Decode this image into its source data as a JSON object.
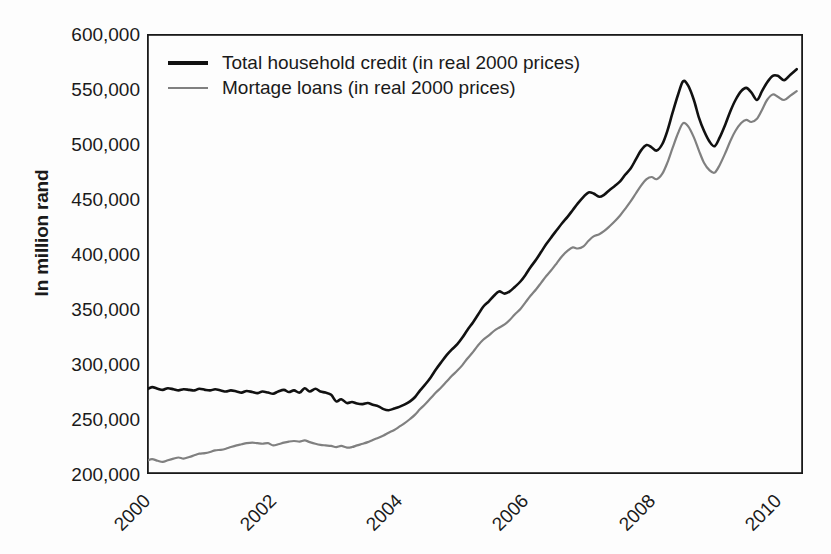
{
  "chart_data": {
    "type": "line",
    "title": "",
    "subtitle": "",
    "xlabel": "",
    "ylabel": "In million rand",
    "xlim": [
      2000.0,
      2010.4
    ],
    "ylim": [
      200000,
      600000
    ],
    "grid": false,
    "legend_position": "top-left-inside",
    "y_tick_labels": [
      "600,000",
      "550,000",
      "500,000",
      "450,000",
      "400,000",
      "350,000",
      "300,000",
      "250,000",
      "200,000"
    ],
    "y_tick_values": [
      600000,
      550000,
      500000,
      450000,
      400000,
      350000,
      300000,
      250000,
      200000
    ],
    "x_tick_labels": [
      "2000",
      "2002",
      "2004",
      "2006",
      "2008",
      "2010"
    ],
    "x_tick_values": [
      2000,
      2002,
      2004,
      2006,
      2008,
      2010
    ],
    "series": [
      {
        "name": "Total household credit (in real 2000 prices)",
        "color": "#111111",
        "width": 2.6,
        "x": [
          2000.0,
          2000.08,
          2000.17,
          2000.25,
          2000.33,
          2000.42,
          2000.5,
          2000.58,
          2000.67,
          2000.75,
          2000.83,
          2000.92,
          2001.0,
          2001.08,
          2001.17,
          2001.25,
          2001.33,
          2001.42,
          2001.5,
          2001.58,
          2001.67,
          2001.75,
          2001.83,
          2001.92,
          2002.0,
          2002.08,
          2002.17,
          2002.25,
          2002.33,
          2002.42,
          2002.5,
          2002.58,
          2002.67,
          2002.75,
          2002.83,
          2002.92,
          2003.0,
          2003.08,
          2003.17,
          2003.25,
          2003.33,
          2003.42,
          2003.5,
          2003.58,
          2003.67,
          2003.75,
          2003.83,
          2003.92,
          2004.0,
          2004.08,
          2004.17,
          2004.25,
          2004.33,
          2004.42,
          2004.5,
          2004.58,
          2004.67,
          2004.75,
          2004.83,
          2004.92,
          2005.0,
          2005.08,
          2005.17,
          2005.25,
          2005.33,
          2005.42,
          2005.5,
          2005.58,
          2005.67,
          2005.75,
          2005.83,
          2005.92,
          2006.0,
          2006.08,
          2006.17,
          2006.25,
          2006.33,
          2006.42,
          2006.5,
          2006.58,
          2006.67,
          2006.75,
          2006.83,
          2006.92,
          2007.0,
          2007.08,
          2007.17,
          2007.25,
          2007.33,
          2007.42,
          2007.5,
          2007.58,
          2007.67,
          2007.75,
          2007.83,
          2007.92,
          2008.0,
          2008.08,
          2008.17,
          2008.25,
          2008.33,
          2008.42,
          2008.5,
          2008.58,
          2008.67,
          2008.75,
          2008.83,
          2008.92,
          2009.0,
          2009.08,
          2009.17,
          2009.25,
          2009.33,
          2009.42,
          2009.5,
          2009.58,
          2009.67,
          2009.75,
          2009.83,
          2009.92,
          2010.0,
          2010.1,
          2010.2,
          2010.3
        ],
        "y": [
          277000,
          279000,
          277500,
          276500,
          278000,
          277000,
          276000,
          277000,
          276500,
          276000,
          277500,
          276500,
          276000,
          277000,
          276000,
          275000,
          276000,
          275000,
          274000,
          275500,
          274500,
          273500,
          275000,
          274000,
          273000,
          275000,
          276500,
          274500,
          276000,
          274000,
          278000,
          275000,
          277500,
          275000,
          274000,
          272000,
          266000,
          268000,
          264500,
          265500,
          264000,
          263500,
          264500,
          263000,
          261500,
          259000,
          258000,
          259500,
          261000,
          263000,
          266000,
          270000,
          276000,
          282000,
          288000,
          295000,
          302000,
          308000,
          313000,
          318000,
          324000,
          331000,
          338000,
          345000,
          352000,
          357000,
          362000,
          366000,
          364000,
          366000,
          370000,
          375000,
          381000,
          388000,
          395000,
          402000,
          409000,
          416000,
          422000,
          428000,
          434000,
          440000,
          446000,
          452000,
          456000,
          455000,
          452000,
          454000,
          458000,
          462000,
          466000,
          472000,
          478000,
          486000,
          494000,
          499000,
          497000,
          494000,
          500000,
          512000,
          528000,
          545000,
          557000,
          553000,
          540000,
          524000,
          512000,
          502000,
          498000,
          506000,
          518000,
          530000,
          540000,
          548000,
          551000,
          547000,
          540000,
          548000,
          556000,
          562000,
          562000,
          558000,
          563000,
          568000
        ]
      },
      {
        "name": "Mortage loans (in real 2000 prices)",
        "color": "#808080",
        "width": 2.2,
        "x": [
          2000.0,
          2000.08,
          2000.17,
          2000.25,
          2000.33,
          2000.42,
          2000.5,
          2000.58,
          2000.67,
          2000.75,
          2000.83,
          2000.92,
          2001.0,
          2001.08,
          2001.17,
          2001.25,
          2001.33,
          2001.42,
          2001.5,
          2001.58,
          2001.67,
          2001.75,
          2001.83,
          2001.92,
          2002.0,
          2002.08,
          2002.17,
          2002.25,
          2002.33,
          2002.42,
          2002.5,
          2002.58,
          2002.67,
          2002.75,
          2002.83,
          2002.92,
          2003.0,
          2003.08,
          2003.17,
          2003.25,
          2003.33,
          2003.42,
          2003.5,
          2003.58,
          2003.67,
          2003.75,
          2003.83,
          2003.92,
          2004.0,
          2004.08,
          2004.17,
          2004.25,
          2004.33,
          2004.42,
          2004.5,
          2004.58,
          2004.67,
          2004.75,
          2004.83,
          2004.92,
          2005.0,
          2005.08,
          2005.17,
          2005.25,
          2005.33,
          2005.42,
          2005.5,
          2005.58,
          2005.67,
          2005.75,
          2005.83,
          2005.92,
          2006.0,
          2006.08,
          2006.17,
          2006.25,
          2006.33,
          2006.42,
          2006.5,
          2006.58,
          2006.67,
          2006.75,
          2006.83,
          2006.92,
          2007.0,
          2007.08,
          2007.17,
          2007.25,
          2007.33,
          2007.42,
          2007.5,
          2007.58,
          2007.67,
          2007.75,
          2007.83,
          2007.92,
          2008.0,
          2008.08,
          2008.17,
          2008.25,
          2008.33,
          2008.42,
          2008.5,
          2008.58,
          2008.67,
          2008.75,
          2008.83,
          2008.92,
          2009.0,
          2009.08,
          2009.17,
          2009.25,
          2009.33,
          2009.42,
          2009.5,
          2009.58,
          2009.67,
          2009.75,
          2009.83,
          2009.92,
          2010.0,
          2010.1,
          2010.2,
          2010.3
        ],
        "y": [
          212000,
          213500,
          212000,
          211000,
          212500,
          214000,
          215000,
          214000,
          215500,
          217000,
          218500,
          219000,
          220000,
          221500,
          222000,
          223000,
          224500,
          226000,
          227000,
          228000,
          228500,
          228000,
          227500,
          228000,
          226000,
          227000,
          228500,
          229500,
          230000,
          229500,
          230500,
          229000,
          227500,
          226500,
          226000,
          225500,
          224500,
          225500,
          224000,
          224500,
          226000,
          227500,
          229000,
          231000,
          233000,
          235000,
          237500,
          240000,
          243000,
          246000,
          250000,
          254000,
          259000,
          264000,
          269000,
          274000,
          279000,
          284000,
          289000,
          294000,
          299000,
          305000,
          311000,
          317000,
          322000,
          326000,
          330000,
          333000,
          336000,
          340000,
          345000,
          350000,
          356000,
          362000,
          368000,
          374000,
          380000,
          386000,
          392000,
          398000,
          403000,
          406000,
          405000,
          407000,
          412000,
          416000,
          418000,
          421000,
          425000,
          430000,
          435000,
          441000,
          448000,
          455000,
          462000,
          468000,
          470000,
          468000,
          473000,
          483000,
          496000,
          510000,
          519000,
          516000,
          506000,
          494000,
          483000,
          476000,
          474000,
          481000,
          492000,
          503000,
          512000,
          519000,
          522000,
          520000,
          523000,
          531000,
          540000,
          545000,
          543000,
          540000,
          544000,
          548000
        ]
      }
    ]
  },
  "legend": {
    "items": [
      {
        "label": "Total household credit (in real 2000 prices)",
        "style": "thick"
      },
      {
        "label": "Mortage loans (in real 2000 prices)",
        "style": "thin"
      }
    ]
  },
  "axes": {
    "y_title": "In million rand",
    "axis_color": "#1a1a1a"
  }
}
